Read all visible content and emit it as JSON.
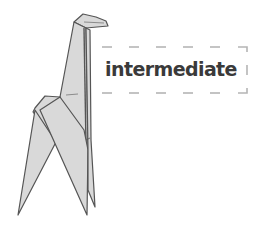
{
  "illustration": {
    "subject": "origami-giraffe",
    "fill_color": "#d9d9d9",
    "stroke_color": "#555555"
  },
  "label": {
    "text": "intermediate",
    "text_color": "#3a3a3a",
    "border_color": "#b5b5b5",
    "border_style": "dashed"
  }
}
